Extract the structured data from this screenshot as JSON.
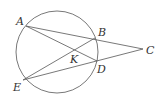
{
  "diagram": {
    "type": "geometry",
    "circle": {
      "cx": 57,
      "cy": 52,
      "r": 41
    },
    "points": {
      "A": {
        "label": "A",
        "x": 26,
        "y": 26,
        "lx": 16,
        "ly": 25
      },
      "B": {
        "label": "B",
        "x": 95,
        "y": 38,
        "lx": 98,
        "ly": 36
      },
      "C": {
        "label": "C",
        "x": 143,
        "y": 49,
        "lx": 146,
        "ly": 54
      },
      "D": {
        "label": "D",
        "x": 97,
        "y": 61,
        "lx": 97,
        "ly": 73
      },
      "E": {
        "label": "E",
        "x": 23,
        "y": 80,
        "lx": 13,
        "ly": 91
      },
      "K": {
        "label": "K",
        "x": 74,
        "y": 52,
        "lx": 70,
        "ly": 63
      }
    },
    "segments": [
      [
        "A",
        "C"
      ],
      [
        "E",
        "C"
      ],
      [
        "A",
        "D"
      ],
      [
        "E",
        "B"
      ]
    ]
  }
}
